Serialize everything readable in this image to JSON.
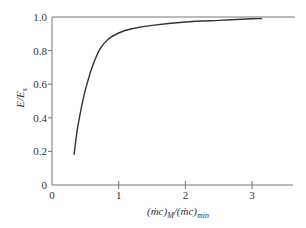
{
  "chart_data": {
    "type": "line",
    "title": "",
    "xlabel": "(ṁc)_M/(ṁc)_min",
    "xlabel_parts": {
      "a": "(ṁc)",
      "sub1": "M",
      "b": "/(ṁc)",
      "sub2": "min"
    },
    "ylabel": "E/E_s",
    "ylabel_parts": {
      "main": "E/E",
      "sub": "s"
    },
    "xlim": [
      0,
      3.6
    ],
    "ylim": [
      0,
      1.0
    ],
    "xticks": [
      0,
      1,
      2,
      3
    ],
    "xtick_labels": [
      "0",
      "1",
      "2",
      "3"
    ],
    "yticks": [
      0,
      0.2,
      0.4,
      0.6,
      0.8,
      1.0
    ],
    "ytick_labels": [
      "0",
      "0.2",
      "0.4",
      "0.6",
      "0.8",
      "1.0"
    ],
    "reference_line_y": 1.0,
    "grid": false,
    "series": [
      {
        "name": "E/Es",
        "x": [
          0.33,
          0.38,
          0.45,
          0.51,
          0.6,
          0.72,
          0.85,
          1.0,
          1.2,
          1.5,
          2.0,
          2.5,
          3.0,
          3.15
        ],
        "y": [
          0.18,
          0.33,
          0.48,
          0.58,
          0.7,
          0.81,
          0.87,
          0.905,
          0.93,
          0.95,
          0.97,
          0.98,
          0.99,
          0.99
        ]
      }
    ]
  }
}
